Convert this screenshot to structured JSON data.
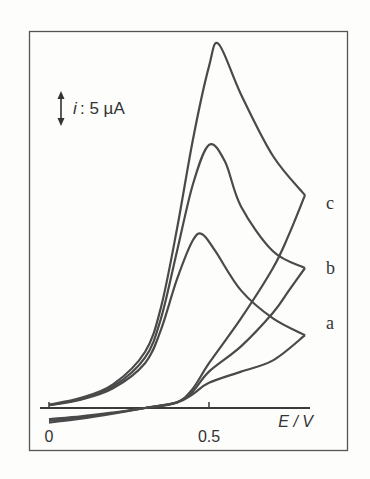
{
  "chart_data": {
    "type": "line",
    "title": "",
    "xlabel": "E / V",
    "ylabel": "i",
    "scale_bar": {
      "label_var": "i",
      "label_value": ": 5 µA",
      "value": 5,
      "unit": "µA"
    },
    "x_ticks": [
      {
        "value": 0,
        "label": "0"
      },
      {
        "value": 0.5,
        "label": "0.5"
      }
    ],
    "xlim": [
      -0.03,
      0.82
    ],
    "ylim": [
      -3,
      68
    ],
    "grid": false,
    "legend_position": "right, inline labels",
    "series": [
      {
        "name": "a",
        "label": "a",
        "peak": {
          "E": 0.48,
          "i": 31
        },
        "forward": [
          [
            0.0,
            0.5
          ],
          [
            0.1,
            1.5
          ],
          [
            0.2,
            3.5
          ],
          [
            0.3,
            8
          ],
          [
            0.35,
            14
          ],
          [
            0.4,
            23
          ],
          [
            0.45,
            30
          ],
          [
            0.48,
            31
          ],
          [
            0.52,
            28
          ],
          [
            0.6,
            21
          ],
          [
            0.7,
            16
          ],
          [
            0.8,
            13
          ]
        ],
        "reverse": [
          [
            0.8,
            13
          ],
          [
            0.7,
            8.5
          ],
          [
            0.6,
            6.5
          ],
          [
            0.5,
            4.5
          ],
          [
            0.45,
            2.5
          ],
          [
            0.4,
            1
          ],
          [
            0.3,
            0
          ],
          [
            0.2,
            -0.8
          ],
          [
            0.1,
            -1.5
          ],
          [
            0.0,
            -2
          ]
        ]
      },
      {
        "name": "b",
        "label": "b",
        "peak": {
          "E": 0.5,
          "i": 47
        },
        "forward": [
          [
            0.0,
            0.5
          ],
          [
            0.1,
            1.6
          ],
          [
            0.2,
            3.8
          ],
          [
            0.3,
            9
          ],
          [
            0.35,
            16
          ],
          [
            0.4,
            28
          ],
          [
            0.45,
            40
          ],
          [
            0.5,
            47
          ],
          [
            0.55,
            44
          ],
          [
            0.6,
            36
          ],
          [
            0.7,
            28
          ],
          [
            0.8,
            25
          ]
        ],
        "reverse": [
          [
            0.8,
            25
          ],
          [
            0.75,
            21
          ],
          [
            0.7,
            17
          ],
          [
            0.6,
            11
          ],
          [
            0.5,
            6.5
          ],
          [
            0.45,
            3
          ],
          [
            0.4,
            1
          ],
          [
            0.3,
            0
          ],
          [
            0.2,
            -0.9
          ],
          [
            0.1,
            -1.7
          ],
          [
            0.0,
            -2.3
          ]
        ]
      },
      {
        "name": "c",
        "label": "c",
        "peak": {
          "E": 0.53,
          "i": 65
        },
        "forward": [
          [
            0.0,
            0.6
          ],
          [
            0.1,
            1.8
          ],
          [
            0.2,
            4.2
          ],
          [
            0.3,
            10
          ],
          [
            0.35,
            18
          ],
          [
            0.4,
            32
          ],
          [
            0.45,
            48
          ],
          [
            0.5,
            61
          ],
          [
            0.53,
            65
          ],
          [
            0.6,
            56
          ],
          [
            0.7,
            45
          ],
          [
            0.8,
            38
          ]
        ],
        "reverse": [
          [
            0.8,
            38
          ],
          [
            0.75,
            31
          ],
          [
            0.7,
            25
          ],
          [
            0.6,
            16
          ],
          [
            0.5,
            8
          ],
          [
            0.45,
            3.5
          ],
          [
            0.4,
            1
          ],
          [
            0.3,
            0
          ],
          [
            0.2,
            -1
          ],
          [
            0.1,
            -1.9
          ],
          [
            0.0,
            -2.6
          ]
        ]
      }
    ]
  }
}
